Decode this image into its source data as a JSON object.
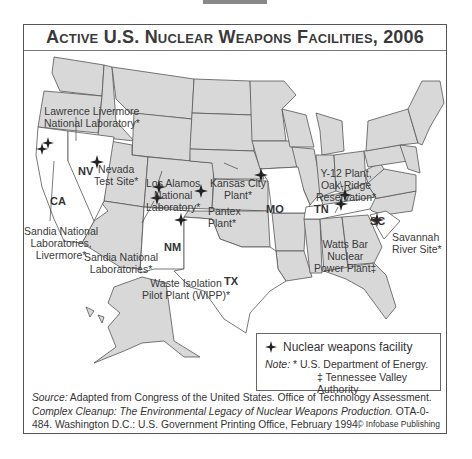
{
  "title": "Active U.S. Nuclear Weapons Facilities, 2006",
  "colors": {
    "state_fill": "#d8d8d8",
    "highlight_fill": "#ffffff",
    "border": "#555555",
    "marker": "#222222"
  },
  "highlighted_states": [
    {
      "abbr": "CA"
    },
    {
      "abbr": "NV"
    },
    {
      "abbr": "NM"
    },
    {
      "abbr": "TX"
    },
    {
      "abbr": "MO"
    },
    {
      "abbr": "TN"
    },
    {
      "abbr": "SC"
    }
  ],
  "facilities": [
    {
      "name": "Lawrence Livermore National Laboratory*",
      "line1": "Lawrence Livermore",
      "line2": "National Laboratory*",
      "state": "CA"
    },
    {
      "name": "Sandia National Laboratories, Livermore*",
      "line1": "Sandia National",
      "line2": "Laboratories,",
      "line3": "Livermore*",
      "state": "CA"
    },
    {
      "name": "Nevada Test Site*",
      "line1": "Nevada",
      "line2": "Test Site*",
      "state": "NV"
    },
    {
      "name": "Los Alamos National Laboratory*",
      "line1": "Los Alamos",
      "line2": "National",
      "line3": "Laboratory*",
      "state": "NM"
    },
    {
      "name": "Sandia National Laboratories*",
      "line1": "Sandia National",
      "line2": "Laboratories*",
      "state": "NM"
    },
    {
      "name": "Waste Isolation Pilot Plant (WIPP)*",
      "line1": "Waste Isolation",
      "line2": "Pilot Plant (WIPP)*",
      "state": "NM"
    },
    {
      "name": "Pantex Plant*",
      "line1": "Pantex",
      "line2": "Plant*",
      "state": "TX"
    },
    {
      "name": "Kansas City Plant*",
      "line1": "Kansas City",
      "line2": "Plant*",
      "state": "MO"
    },
    {
      "name": "Y-12 Plant, Oak-Ridge Reservation*",
      "line1": "Y-12 Plant,",
      "line2": "Oak-Ridge",
      "line3": "Reservation*",
      "state": "TN"
    },
    {
      "name": "Watts Bar Nuclear Power Plant‡",
      "line1": "Watts Bar",
      "line2": "Nuclear",
      "line3": "Power Plant‡",
      "state": "TN"
    },
    {
      "name": "Savannah River Site*",
      "line1": "Savannah",
      "line2": "River Site*",
      "state": "SC"
    }
  ],
  "legend": {
    "marker_label": "Nuclear weapons facility",
    "note_label": "Note:",
    "note_doe": "* U.S. Department of Energy.",
    "note_tva": "‡ Tennessee Valley Authority"
  },
  "source": {
    "label": "Source:",
    "text1": "Adapted from Congress of the United States. Office of Technology Assessment.",
    "title_italic": "Complex Cleanup: The Environmental Legacy of Nuclear Weapons Production.",
    "text2": "OTA-0-484. Washington D.C.: U.S. Government Printing Office, February 1994."
  },
  "copyright": "© Infobase Publishing"
}
